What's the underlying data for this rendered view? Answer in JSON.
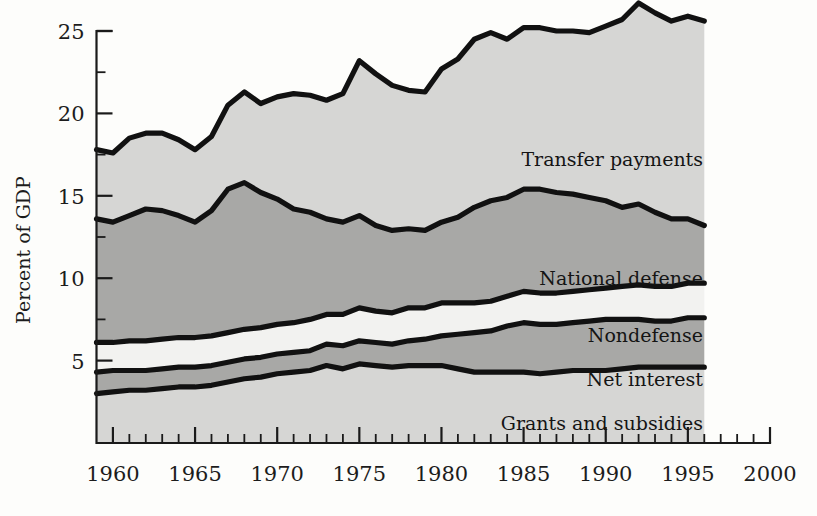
{
  "figure": {
    "ylabel": "Percent of GDP",
    "background": "#fdfdfb",
    "ink": "#111111"
  },
  "axis": {
    "y_ticks_major": [
      5,
      10,
      15,
      20,
      25
    ],
    "y_ticks_minor": [
      7.5,
      12.5,
      17.5,
      22.5
    ],
    "x_ticks_major": [
      1960,
      1965,
      1970,
      1975,
      1980,
      1985,
      1990,
      1995,
      2000
    ],
    "x_tick_label_0": "1960",
    "x_tick_label_1": "1965",
    "x_tick_label_2": "1970",
    "x_tick_label_3": "1975",
    "x_tick_label_4": "1980",
    "x_tick_label_5": "1985",
    "x_tick_label_6": "1990",
    "x_tick_label_7": "1995",
    "x_tick_label_8": "2000",
    "y_tick_label_0": "5",
    "y_tick_label_1": "10",
    "y_tick_label_2": "15",
    "y_tick_label_3": "20",
    "y_tick_label_4": "25"
  },
  "labels": {
    "transfer": "Transfer payments",
    "defense": "National defense",
    "nondefense": "Nondefense",
    "interest": "Net interest",
    "grants": "Grants and subsidies"
  },
  "chart_data": {
    "type": "area",
    "stacked": true,
    "title": "",
    "xlabel": "",
    "ylabel": "Percent of GDP",
    "xlim": [
      1959,
      2000
    ],
    "ylim": [
      0,
      25
    ],
    "data_xlim": [
      1959,
      1996
    ],
    "grid": false,
    "legend": "inline-annotations",
    "x": [
      1959,
      1960,
      1961,
      1962,
      1963,
      1964,
      1965,
      1966,
      1967,
      1968,
      1969,
      1970,
      1971,
      1972,
      1973,
      1974,
      1975,
      1976,
      1977,
      1978,
      1979,
      1980,
      1981,
      1982,
      1983,
      1984,
      1985,
      1986,
      1987,
      1988,
      1989,
      1990,
      1991,
      1992,
      1993,
      1994,
      1995,
      1996
    ],
    "series": [
      {
        "name": "Grants and subsidies",
        "fill": "#d6d6d4",
        "values": [
          3.0,
          3.1,
          3.2,
          3.2,
          3.3,
          3.4,
          3.4,
          3.5,
          3.7,
          3.9,
          4.0,
          4.2,
          4.3,
          4.4,
          4.7,
          4.5,
          4.8,
          4.7,
          4.6,
          4.7,
          4.7,
          4.7,
          4.5,
          4.3,
          4.3,
          4.3,
          4.3,
          4.2,
          4.3,
          4.4,
          4.4,
          4.4,
          4.5,
          4.6,
          4.6,
          4.6,
          4.6,
          4.6
        ]
      },
      {
        "name": "Net interest",
        "fill": "#a8a8a6",
        "values": [
          1.3,
          1.3,
          1.2,
          1.2,
          1.2,
          1.2,
          1.2,
          1.2,
          1.2,
          1.2,
          1.2,
          1.2,
          1.2,
          1.2,
          1.3,
          1.4,
          1.4,
          1.4,
          1.4,
          1.5,
          1.6,
          1.8,
          2.1,
          2.4,
          2.5,
          2.8,
          3.0,
          3.0,
          2.9,
          2.9,
          3.0,
          3.1,
          3.0,
          2.9,
          2.8,
          2.8,
          3.0,
          3.0
        ]
      },
      {
        "name": "Nondefense",
        "fill": "#f2f2f0",
        "values": [
          1.8,
          1.7,
          1.8,
          1.8,
          1.8,
          1.8,
          1.8,
          1.8,
          1.8,
          1.8,
          1.8,
          1.8,
          1.8,
          1.9,
          1.8,
          1.9,
          2.0,
          1.9,
          1.9,
          2.0,
          1.9,
          2.0,
          1.9,
          1.8,
          1.8,
          1.8,
          1.9,
          1.9,
          1.9,
          1.9,
          1.9,
          1.9,
          2.0,
          2.1,
          2.1,
          2.1,
          2.1,
          2.1
        ]
      },
      {
        "name": "National defense",
        "fill": "#a8a8a6",
        "values": [
          7.5,
          7.3,
          7.6,
          8.0,
          7.8,
          7.4,
          7.0,
          7.6,
          8.7,
          8.9,
          8.2,
          7.6,
          6.9,
          6.5,
          5.8,
          5.6,
          5.6,
          5.2,
          5.0,
          4.8,
          4.7,
          4.9,
          5.2,
          5.8,
          6.1,
          6.0,
          6.2,
          6.3,
          6.1,
          5.9,
          5.6,
          5.3,
          4.8,
          4.9,
          4.5,
          4.1,
          3.9,
          3.5
        ]
      },
      {
        "name": "Transfer payments",
        "fill": "#d6d6d4",
        "values": [
          4.2,
          4.2,
          4.7,
          4.6,
          4.7,
          4.6,
          4.4,
          4.5,
          5.1,
          5.5,
          5.4,
          6.2,
          7.0,
          7.1,
          7.2,
          7.8,
          9.4,
          9.2,
          8.8,
          8.4,
          8.4,
          9.3,
          9.6,
          10.2,
          10.2,
          9.6,
          9.8,
          9.8,
          9.8,
          9.9,
          10.0,
          10.6,
          11.4,
          12.2,
          12.1,
          12.0,
          12.3,
          12.4
        ]
      }
    ],
    "totals_note": "Top boundary = total federal outlays as percent of GDP"
  }
}
